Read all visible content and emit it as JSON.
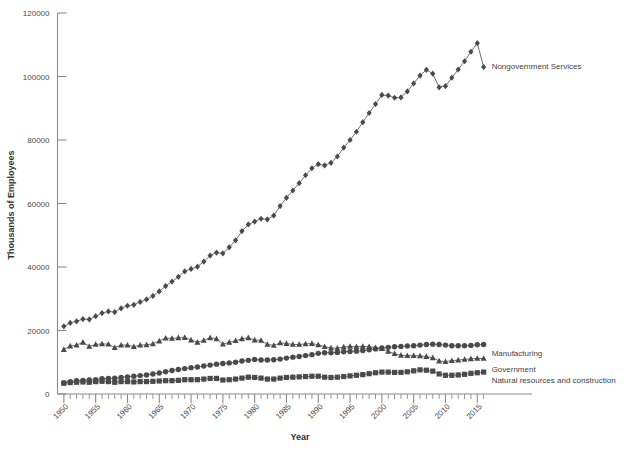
{
  "chart_data": {
    "type": "line",
    "title": "",
    "subtitle": "",
    "xlabel": "Year",
    "ylabel": "Thousands of Employees",
    "xlim": [
      1949,
      2017
    ],
    "ylim": [
      0,
      120000
    ],
    "grid": false,
    "legend_position": "right-inline-labels",
    "y_ticks": [
      0,
      20000,
      40000,
      60000,
      80000,
      100000,
      120000
    ],
    "y_tick_labels": [
      "0",
      "20000",
      "40000",
      "60000",
      "80000",
      "100000",
      "120000"
    ],
    "x_ticks": [
      1950,
      1955,
      1960,
      1965,
      1970,
      1975,
      1980,
      1985,
      1990,
      1995,
      2000,
      2005,
      2010,
      2015
    ],
    "x_tick_labels": [
      "1950",
      "1955",
      "1960",
      "1965",
      "1970",
      "1975",
      "1980",
      "1985",
      "1990",
      "1995",
      "2000",
      "2005",
      "2010",
      "2015"
    ],
    "x_minor_tick_interval": 1,
    "marker_color": "#4a4a4a",
    "line_color": "#555555",
    "axis_color": "#8a8a8a",
    "background_color": "#ffffff",
    "x": [
      1950,
      1951,
      1952,
      1953,
      1954,
      1955,
      1956,
      1957,
      1958,
      1959,
      1960,
      1961,
      1962,
      1963,
      1964,
      1965,
      1966,
      1967,
      1968,
      1969,
      1970,
      1971,
      1972,
      1973,
      1974,
      1975,
      1976,
      1977,
      1978,
      1979,
      1980,
      1981,
      1982,
      1983,
      1984,
      1985,
      1986,
      1987,
      1988,
      1989,
      1990,
      1991,
      1992,
      1993,
      1994,
      1995,
      1996,
      1997,
      1998,
      1999,
      2000,
      2001,
      2002,
      2003,
      2004,
      2005,
      2006,
      2007,
      2008,
      2009,
      2010,
      2011,
      2012,
      2013,
      2014,
      2015,
      2016
    ],
    "series": [
      {
        "name": "Nongovernment Services",
        "marker": "diamond",
        "label_x": 2016,
        "label_y": 103000,
        "values": [
          21300,
          22400,
          22900,
          23600,
          23500,
          24500,
          25500,
          26000,
          25800,
          27000,
          27800,
          28100,
          29000,
          29800,
          30900,
          32300,
          34000,
          35400,
          36900,
          38600,
          39400,
          40100,
          41700,
          43600,
          44500,
          44300,
          46200,
          48400,
          51300,
          53400,
          54300,
          55200,
          55000,
          56200,
          59200,
          61800,
          64100,
          66400,
          68900,
          71100,
          72400,
          72000,
          72800,
          74800,
          77600,
          80000,
          82600,
          85600,
          88500,
          91300,
          94200,
          94000,
          93300,
          93400,
          95300,
          97800,
          100300,
          102100,
          100900,
          96600,
          97000,
          99600,
          102200,
          104800,
          107800,
          110500,
          103000
        ]
      },
      {
        "name": "Manufacturing",
        "marker": "triangle",
        "label_x": 2016,
        "label_y": 12500,
        "values": [
          14000,
          15100,
          15400,
          16300,
          15000,
          15600,
          15800,
          15700,
          14600,
          15400,
          15400,
          14900,
          15400,
          15500,
          15800,
          16700,
          17600,
          17500,
          17700,
          17800,
          17000,
          16300,
          16900,
          17700,
          17400,
          15700,
          16300,
          16800,
          17400,
          17700,
          17000,
          16900,
          15600,
          15300,
          16100,
          15900,
          15600,
          15600,
          15800,
          15900,
          15500,
          14900,
          14500,
          14400,
          14800,
          15000,
          14900,
          15000,
          14900,
          14600,
          14300,
          13400,
          12700,
          12200,
          12100,
          12100,
          12000,
          11800,
          11400,
          10400,
          10200,
          10500,
          10700,
          10900,
          11100,
          11200,
          11200
        ]
      },
      {
        "name": "Government",
        "marker": "circle",
        "label_x": 2016,
        "label_y": 7500,
        "values": [
          3500,
          3900,
          4200,
          4300,
          4400,
          4500,
          4800,
          4900,
          5000,
          5200,
          5400,
          5600,
          5800,
          6000,
          6300,
          6600,
          7000,
          7400,
          7700,
          8000,
          8300,
          8500,
          8800,
          9100,
          9400,
          9600,
          9800,
          10000,
          10400,
          10600,
          10900,
          10700,
          10700,
          10800,
          11000,
          11300,
          11600,
          11800,
          12100,
          12400,
          12800,
          13000,
          13000,
          13100,
          13300,
          13400,
          13500,
          13700,
          13900,
          14200,
          14500,
          14700,
          14900,
          15000,
          15100,
          15200,
          15400,
          15600,
          15700,
          15600,
          15400,
          15200,
          15200,
          15200,
          15300,
          15500,
          15600
        ]
      },
      {
        "name": "Natural resources and construction",
        "marker": "square",
        "label_x": 2016,
        "label_y": 4000,
        "values": [
          3400,
          3600,
          3700,
          3800,
          3700,
          3900,
          4000,
          3900,
          3700,
          3900,
          3900,
          3800,
          3900,
          3900,
          4000,
          4100,
          4200,
          4200,
          4300,
          4500,
          4500,
          4500,
          4700,
          4900,
          4900,
          4400,
          4500,
          4700,
          5000,
          5300,
          5200,
          5000,
          4700,
          4700,
          5000,
          5200,
          5300,
          5400,
          5500,
          5600,
          5600,
          5300,
          5200,
          5300,
          5500,
          5700,
          5900,
          6100,
          6400,
          6700,
          6900,
          6900,
          6800,
          6800,
          7000,
          7300,
          7600,
          7500,
          7200,
          6300,
          5900,
          5900,
          6000,
          6200,
          6500,
          6700,
          6900
        ]
      }
    ]
  },
  "labels": {
    "y_axis_title": "Thousands of Employees",
    "x_axis_title": "Year",
    "series_nongovernment": "Nongovernment Services",
    "series_manufacturing": "Manufacturing",
    "series_government": "Government",
    "series_natural": "Natural resources and construction"
  }
}
